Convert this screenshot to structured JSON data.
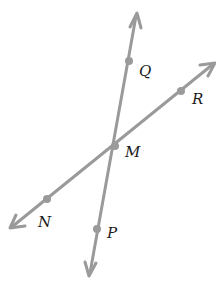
{
  "diagram": {
    "type": "intersecting-lines",
    "colors": {
      "line": "#9a9a9a",
      "point": "#9a9a9a",
      "label": "#1a1a1a",
      "background": "#ffffff"
    },
    "lines": [
      {
        "name": "line-QP",
        "through": [
          "Q",
          "M",
          "P"
        ],
        "arrow_start": [
          137,
          13
        ],
        "arrow_end": [
          89,
          276
        ]
      },
      {
        "name": "line-RN",
        "through": [
          "R",
          "M",
          "N"
        ],
        "arrow_start": [
          215,
          63
        ],
        "arrow_end": [
          10,
          228
        ]
      }
    ],
    "points": {
      "Q": {
        "label": "Q",
        "x": 129,
        "y": 61
      },
      "R": {
        "label": "R",
        "x": 181,
        "y": 91
      },
      "M": {
        "label": "M",
        "x": 115,
        "y": 146
      },
      "N": {
        "label": "N",
        "x": 47,
        "y": 199
      },
      "P": {
        "label": "P",
        "x": 97,
        "y": 229
      }
    }
  }
}
